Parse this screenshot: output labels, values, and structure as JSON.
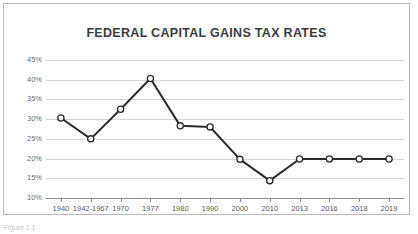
{
  "figure": {
    "caption": "Figure 1.1",
    "border_color": "#b9b9b9"
  },
  "chart_data": {
    "type": "line",
    "title": "FEDERAL CAPITAL GAINS TAX RATES",
    "xlabel": "",
    "ylabel": "",
    "categories": [
      "1940",
      "1942-1967",
      "1970",
      "1977",
      "1980",
      "1990",
      "2000",
      "2010",
      "2013",
      "2016",
      "2018",
      "2019"
    ],
    "values": [
      30.3,
      25.0,
      32.5,
      40.3,
      28.3,
      28.0,
      19.8,
      14.4,
      19.9,
      19.9,
      19.9,
      19.9
    ],
    "value_suffix": "%",
    "ylim": [
      10,
      45
    ],
    "ytick_values": [
      10,
      15,
      20,
      25,
      30,
      35,
      40,
      45
    ],
    "ytick_labels": [
      "10%",
      "15%",
      "20%",
      "25%",
      "30%",
      "35%",
      "40%",
      "45%"
    ],
    "grid": true,
    "legend": false,
    "series_color": "#2b2b2b",
    "marker": "circle-open",
    "marker_fill": "#ffffff",
    "gridline_color": "#d6d6d6",
    "axis_color": "#8f8f8f",
    "title_color": "#3b3b3b",
    "tick_label_color": "#6b6b6b"
  }
}
